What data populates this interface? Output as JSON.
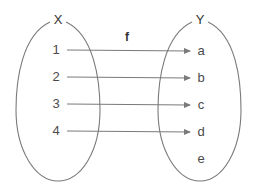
{
  "diagram": {
    "type": "function-mapping",
    "function_label": "f",
    "domain": {
      "label": "X",
      "elements": [
        "1",
        "2",
        "3",
        "4"
      ]
    },
    "codomain": {
      "label": "Y",
      "elements": [
        "a",
        "b",
        "c",
        "d",
        "e"
      ]
    },
    "mappings": [
      {
        "from": "1",
        "to": "a"
      },
      {
        "from": "2",
        "to": "b"
      },
      {
        "from": "3",
        "to": "c"
      },
      {
        "from": "4",
        "to": "d"
      }
    ],
    "colors": {
      "line": "#7a7a7a",
      "text": "#4a4a4a"
    }
  }
}
